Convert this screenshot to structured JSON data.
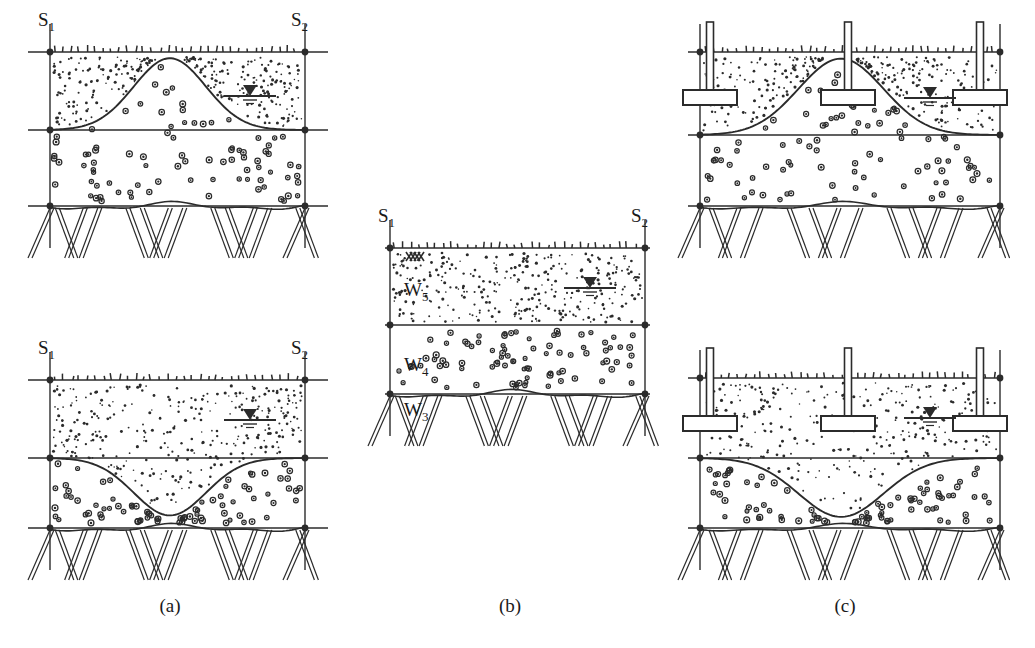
{
  "figure": {
    "background": "#ffffff",
    "ink": "#2b2b2b",
    "captions": [
      {
        "id": "a",
        "text": "(a)",
        "x": 170,
        "y": 612
      },
      {
        "id": "b",
        "text": "(b)",
        "x": 510,
        "y": 612
      },
      {
        "id": "c",
        "text": "(c)",
        "x": 845,
        "y": 612
      }
    ]
  },
  "borehole_labels": {
    "left": {
      "base": "S",
      "sub": "1"
    },
    "right": {
      "base": "S",
      "sub": "2"
    }
  },
  "layer_labels": [
    {
      "base": "W",
      "sub": "5",
      "x": 404,
      "y": 296,
      "panel": "b"
    },
    {
      "base": "W",
      "sub": "4",
      "x": 404,
      "y": 371,
      "panel": "b"
    },
    {
      "base": "W",
      "sub": "3",
      "x": 404,
      "y": 416,
      "panel": "b"
    }
  ],
  "panels": [
    {
      "name": "panel-a-top",
      "caption_ref": "a",
      "x": 28,
      "y": 30,
      "w": 300,
      "h": 215,
      "bore_left": 50,
      "bore_right": 305,
      "ground_y": 52,
      "mid_y": 130,
      "rock_y": 206,
      "interface_shape": "mound",
      "water_table": {
        "x": 250,
        "y": 96
      },
      "has_footings": false,
      "surface_marker": false
    },
    {
      "name": "panel-a-bottom",
      "caption_ref": "a",
      "x": 28,
      "y": 355,
      "w": 300,
      "h": 215,
      "bore_left": 50,
      "bore_right": 305,
      "ground_y": 380,
      "mid_y": 458,
      "rock_y": 528,
      "interface_shape": "trough",
      "water_table": {
        "x": 250,
        "y": 420
      },
      "has_footings": false,
      "surface_marker": false
    },
    {
      "name": "panel-b",
      "caption_ref": "b",
      "x": 385,
      "y": 228,
      "w": 265,
      "h": 200,
      "bore_left": 390,
      "bore_right": 645,
      "ground_y": 248,
      "mid_y": 325,
      "rock_y": 394,
      "interface_shape": "flat",
      "water_table": {
        "x": 590,
        "y": 288
      },
      "has_footings": false,
      "surface_marker": true
    },
    {
      "name": "panel-c-top",
      "caption_ref": "c",
      "x": 688,
      "y": 30,
      "w": 312,
      "h": 215,
      "bore_left": 700,
      "bore_right": 1000,
      "ground_y": 52,
      "mid_y": 135,
      "rock_y": 206,
      "interface_shape": "mound",
      "water_table": {
        "x": 930,
        "y": 98
      },
      "has_footings": true,
      "surface_marker": false
    },
    {
      "name": "panel-c-bottom",
      "caption_ref": "c",
      "x": 688,
      "y": 355,
      "w": 312,
      "h": 215,
      "bore_left": 700,
      "bore_right": 1000,
      "ground_y": 378,
      "mid_y": 458,
      "rock_y": 528,
      "interface_shape": "trough",
      "water_table": {
        "x": 930,
        "y": 418
      },
      "has_footings": true,
      "surface_marker": false
    }
  ],
  "footings": {
    "count_per_panel": 3,
    "offsets_x": [
      22,
      160,
      292
    ],
    "column_width": 7,
    "pad_width": 54,
    "pad_height": 15,
    "pad_depth_below_ground": 38,
    "column_height_above_ground": 30
  },
  "legend_semantics": {
    "W5": "upper fine-grained soil layer (fine stipple)",
    "W4": "intermediate gravelly layer (coarse ring stipple)",
    "W3": "bedrock (diagonal hatch)",
    "S1": "borehole sounding line left",
    "S2": "borehole sounding line right",
    "water-table": "groundwater level symbol"
  }
}
